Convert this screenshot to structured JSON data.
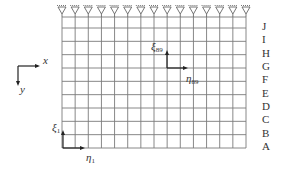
{
  "figure": {
    "type": "structural grid model",
    "grid": {
      "columns": 15,
      "rows": 10,
      "row_labels": [
        "J",
        "I",
        "H",
        "G",
        "F",
        "E",
        "D",
        "C",
        "B",
        "A"
      ],
      "support_count": 15,
      "support_type": "pinned",
      "line_color": "#7a7a7a"
    },
    "global_axes": {
      "x_label": "x",
      "y_label": "y"
    },
    "local_axes": [
      {
        "id": "1",
        "xi_label": "ξ",
        "eta_label": "η",
        "subscript": "1"
      },
      {
        "id": "89",
        "xi_label": "ξ",
        "eta_label": "η",
        "subscript": "89"
      }
    ]
  }
}
